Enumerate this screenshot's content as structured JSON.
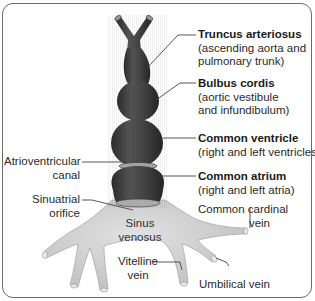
{
  "diagram": {
    "colors": {
      "heart_tube": "#3f3f3f",
      "heart_highlight": "#6a6a6a",
      "sinus_venosus": "#d2d2d2",
      "border": "#6b6b6b",
      "leader_line": "#444444"
    },
    "labels": {
      "truncus": {
        "title": "Truncus arteriosus",
        "line1": "(ascending aorta and",
        "line2": "pulmonary trunk)"
      },
      "bulbus": {
        "title": "Bulbus cordis",
        "line1": "(aortic vestibule",
        "line2": "and infundibulum)"
      },
      "ventricle": {
        "title": "Common ventricle",
        "line1": "(right and left ventricles)"
      },
      "atrium": {
        "title": "Common atrium",
        "line1": "(right and left atria)"
      },
      "av_canal": {
        "line1": "Atrioventricular",
        "line2": "canal"
      },
      "sa_orifice": {
        "line1": "Sinuatrial",
        "line2": "orifice"
      },
      "sinus": {
        "line1": "Sinus",
        "line2": "venosus"
      },
      "cardinal": {
        "line1": "Common cardinal",
        "line2": "vein"
      },
      "vitelline": {
        "line1": "Vitelline",
        "line2": "vein"
      },
      "umbilical": {
        "line1": "Umbilical vein"
      }
    }
  }
}
